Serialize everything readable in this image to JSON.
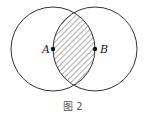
{
  "figure": {
    "caption": "图 2",
    "points": [
      {
        "label": "A",
        "x": 53,
        "y": 49
      },
      {
        "label": "B",
        "x": 95,
        "y": 49
      }
    ],
    "circles": [
      {
        "center": "A",
        "cx": 53,
        "cy": 49,
        "r": 42
      },
      {
        "center": "B",
        "cx": 95,
        "cy": 49,
        "r": 42
      }
    ],
    "shaded_region": "intersection of circle A and circle B (hatched)",
    "colors": {
      "stroke": "#333333",
      "hatch": "#444444",
      "background": "#ffffff"
    }
  }
}
